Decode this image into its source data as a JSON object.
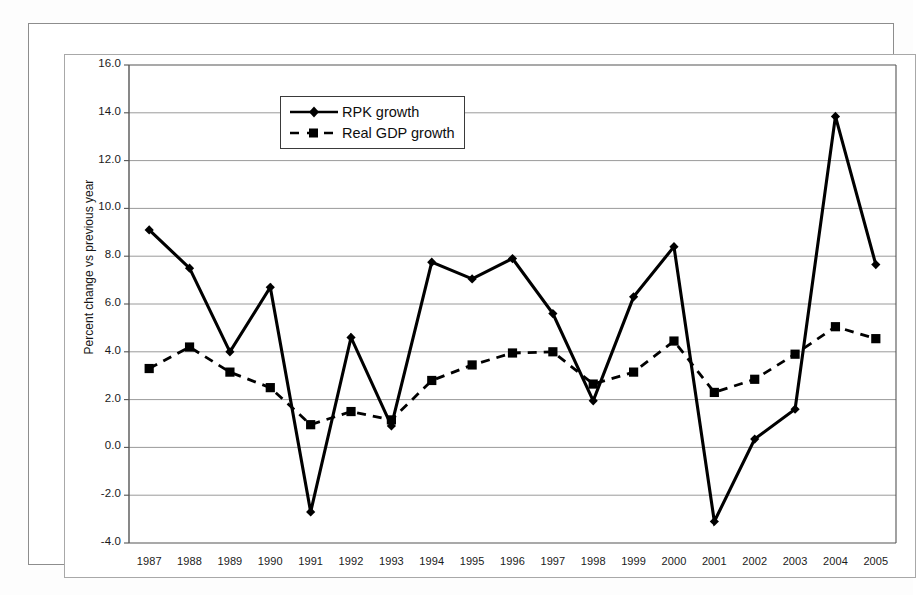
{
  "chart_data": {
    "type": "line",
    "title": "",
    "xlabel": "",
    "ylabel": "Percent change vs previous year",
    "categories": [
      "1987",
      "1988",
      "1989",
      "1990",
      "1991",
      "1992",
      "1993",
      "1994",
      "1995",
      "1996",
      "1997",
      "1998",
      "1999",
      "2000",
      "2001",
      "2002",
      "2003",
      "2004",
      "2005"
    ],
    "x": [
      1987,
      1988,
      1989,
      1990,
      1991,
      1992,
      1993,
      1994,
      1995,
      1996,
      1997,
      1998,
      1999,
      2000,
      2001,
      2002,
      2003,
      2004,
      2005
    ],
    "ylim": [
      -4.0,
      16.0
    ],
    "ytick_step": 2.0,
    "yticks": [
      "16.0",
      "14.0",
      "12.0",
      "10.0",
      "8.0",
      "6.0",
      "4.0",
      "2.0",
      "0.0",
      "-2.0",
      "-4.0"
    ],
    "ytick_values": [
      16.0,
      14.0,
      12.0,
      10.0,
      8.0,
      6.0,
      4.0,
      2.0,
      0.0,
      -2.0,
      -4.0
    ],
    "grid": true,
    "grid_axis": "y",
    "legend_position": "top-center",
    "series": [
      {
        "name": "RPK growth",
        "marker": "diamond",
        "linestyle": "solid",
        "color": "#000000",
        "values": [
          9.1,
          7.5,
          4.0,
          6.7,
          -2.7,
          4.6,
          0.9,
          7.75,
          7.05,
          7.9,
          5.6,
          1.95,
          6.3,
          8.4,
          -3.1,
          0.35,
          1.6,
          13.85,
          7.65
        ]
      },
      {
        "name": "Real GDP growth",
        "marker": "square",
        "linestyle": "dashed",
        "color": "#000000",
        "values": [
          3.3,
          4.2,
          3.15,
          2.5,
          0.95,
          1.5,
          1.15,
          2.8,
          3.45,
          3.95,
          4.0,
          2.65,
          3.15,
          4.45,
          2.3,
          2.85,
          3.9,
          5.05,
          4.55
        ]
      }
    ]
  },
  "legend": {
    "entries": [
      {
        "label": "RPK growth"
      },
      {
        "label": "Real GDP growth"
      }
    ]
  },
  "axes": {
    "y_title": "Percent change vs previous year"
  },
  "colors": {
    "series": "#000000",
    "gridline": "#9a9a9a",
    "axis": "#555555",
    "frame": "#8d8d8d",
    "background": "#ffffff"
  }
}
